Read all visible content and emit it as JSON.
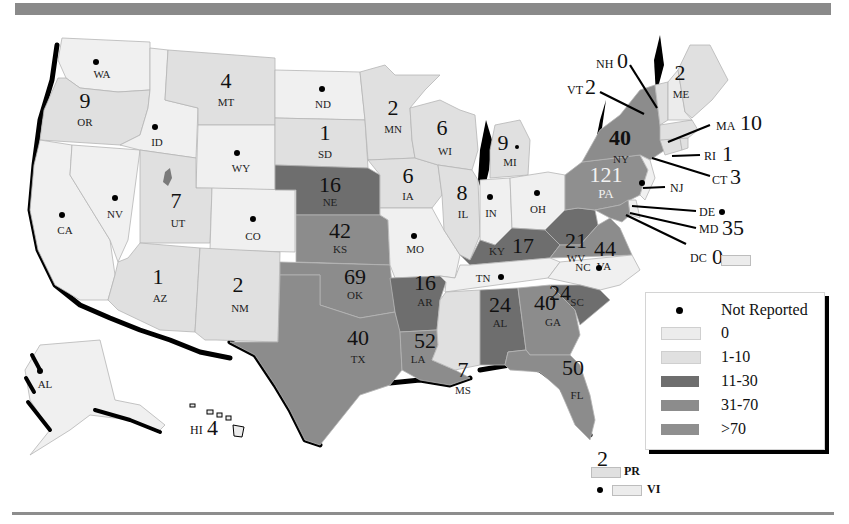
{
  "legend": {
    "not_reported_label": "Not Reported",
    "items": [
      {
        "label": "0",
        "color": "#ececec"
      },
      {
        "label": "1-10",
        "color": "#e0e0e0"
      },
      {
        "label": "11-30",
        "color": "#6e6e6e"
      },
      {
        "label": "31-70",
        "color": "#8c8c8c"
      },
      {
        "label": ">70",
        "color": "#8f8f8f"
      }
    ]
  },
  "colors": {
    "zero": "#ececec",
    "low": "#e0e0e0",
    "mid": "#6e6e6e",
    "high": "#8c8c8c",
    "top": "#8f8f8f",
    "not_reported": "#f0f0f0",
    "bar": "#8a8a8a",
    "coast_shadow": "#000000"
  },
  "states": {
    "WA": {
      "abbr": "WA",
      "value": null,
      "not_reported": true
    },
    "OR": {
      "abbr": "OR",
      "value": "9"
    },
    "CA": {
      "abbr": "CA",
      "value": null,
      "not_reported": true
    },
    "ID": {
      "abbr": "ID",
      "value": null,
      "not_reported": true
    },
    "NV": {
      "abbr": "NV",
      "value": null,
      "not_reported": true
    },
    "MT": {
      "abbr": "MT",
      "value": "4"
    },
    "WY": {
      "abbr": "WY",
      "value": null,
      "not_reported": true
    },
    "UT": {
      "abbr": "UT",
      "value": "7"
    },
    "AZ": {
      "abbr": "AZ",
      "value": "1"
    },
    "CO": {
      "abbr": "CO",
      "value": null,
      "not_reported": true
    },
    "NM": {
      "abbr": "NM",
      "value": "2"
    },
    "ND": {
      "abbr": "ND",
      "value": null,
      "not_reported": true
    },
    "SD": {
      "abbr": "SD",
      "value": "1"
    },
    "NE": {
      "abbr": "NE",
      "value": "16"
    },
    "KS": {
      "abbr": "KS",
      "value": "42"
    },
    "OK": {
      "abbr": "OK",
      "value": "69"
    },
    "TX": {
      "abbr": "TX",
      "value": "40"
    },
    "MN": {
      "abbr": "MN",
      "value": "2"
    },
    "IA": {
      "abbr": "IA",
      "value": "6"
    },
    "MO": {
      "abbr": "MO",
      "value": null,
      "not_reported": true
    },
    "AR": {
      "abbr": "AR",
      "value": "16"
    },
    "LA": {
      "abbr": "LA",
      "value": "52"
    },
    "WI": {
      "abbr": "WI",
      "value": "6"
    },
    "IL": {
      "abbr": "IL",
      "value": "8"
    },
    "MS": {
      "abbr": "MS",
      "value": "7"
    },
    "MI": {
      "abbr": "MI",
      "value": "9",
      "not_reported": true
    },
    "IN": {
      "abbr": "IN",
      "value": null,
      "not_reported": true
    },
    "OH": {
      "abbr": "OH",
      "value": null,
      "not_reported": true
    },
    "KY": {
      "abbr": "KY",
      "value": "17"
    },
    "TN": {
      "abbr": "TN",
      "value": null,
      "not_reported": true
    },
    "AL": {
      "abbr": "AL",
      "value": "24"
    },
    "GA": {
      "abbr": "GA",
      "value": "40"
    },
    "FL": {
      "abbr": "FL",
      "value": "50"
    },
    "SC": {
      "abbr": "SC",
      "value": "24"
    },
    "NC": {
      "abbr": "NC",
      "value": null,
      "not_reported": true
    },
    "VA": {
      "abbr": "VA",
      "value": "44"
    },
    "WV": {
      "abbr": "WV",
      "value": "21"
    },
    "PA": {
      "abbr": "PA",
      "value": "121"
    },
    "NY": {
      "abbr": "NY",
      "value": "40"
    },
    "NJ": {
      "abbr": "NJ",
      "value": null,
      "not_reported": true
    },
    "DE": {
      "abbr": "DE",
      "value": null,
      "not_reported": true
    },
    "MD": {
      "abbr": "MD",
      "value": "35"
    },
    "DC": {
      "abbr": "DC",
      "value": "0"
    },
    "CT": {
      "abbr": "CT",
      "value": "3"
    },
    "RI": {
      "abbr": "RI",
      "value": "1"
    },
    "MA": {
      "abbr": "MA",
      "value": "10"
    },
    "VT": {
      "abbr": "VT",
      "value": "2"
    },
    "NH": {
      "abbr": "NH",
      "value": "0"
    },
    "ME": {
      "abbr": "ME",
      "value": "2"
    },
    "AK": {
      "abbr": "AL",
      "value": null,
      "not_reported": true
    },
    "HI": {
      "abbr": "HI",
      "value": "4"
    },
    "PR": {
      "abbr": "PR",
      "value": "2"
    },
    "VI": {
      "abbr": "VI",
      "value": null,
      "not_reported": true
    }
  }
}
